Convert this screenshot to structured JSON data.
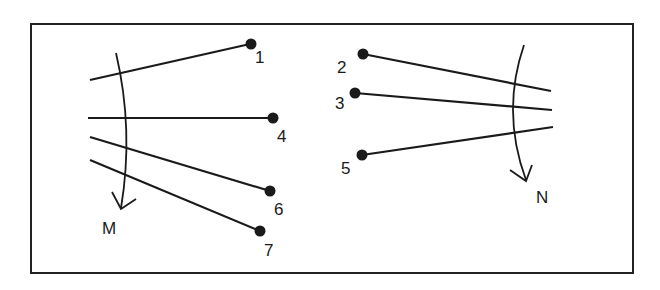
{
  "diagram": {
    "frame": {
      "x": 30,
      "y": 24,
      "width": 603,
      "height": 248,
      "stroke": "#222222"
    },
    "left_group": {
      "arrow_label": "M",
      "rays": [
        {
          "label": "1",
          "start": [
            90,
            80
          ],
          "dot": [
            250,
            44
          ],
          "label_pos": [
            256,
            62
          ]
        },
        {
          "label": "4",
          "start": [
            88,
            118
          ],
          "dot": [
            273,
            118
          ],
          "label_pos": [
            278,
            141
          ]
        },
        {
          "label": "6",
          "start": [
            90,
            137
          ],
          "dot": [
            270,
            191
          ],
          "label_pos": [
            275,
            214
          ]
        },
        {
          "label": "7",
          "start": [
            90,
            160
          ],
          "dot": [
            260,
            231
          ],
          "label_pos": [
            265,
            255
          ]
        }
      ]
    },
    "right_group": {
      "arrow_label": "N",
      "rays": [
        {
          "label": "2",
          "dot": [
            363,
            54
          ],
          "end": [
            551,
            91
          ],
          "label_pos": [
            337,
            72
          ]
        },
        {
          "label": "3",
          "dot": [
            355,
            93
          ],
          "end": [
            552,
            110
          ],
          "label_pos": [
            336,
            108
          ]
        },
        {
          "label": "5",
          "dot": [
            362,
            155
          ],
          "end": [
            553,
            127
          ],
          "label_pos": [
            341,
            173
          ]
        }
      ]
    },
    "colors": {
      "ink": "#1a1a1a",
      "background": "#ffffff"
    }
  }
}
